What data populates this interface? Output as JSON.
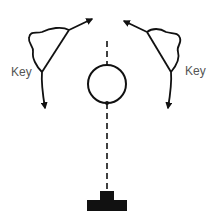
{
  "diagram": {
    "labels": {
      "left_key": "Key",
      "right_key": "Key"
    },
    "elements": {
      "left_key_symbol": "key-triangle-with-arrows",
      "right_key_symbol": "key-triangle-with-arrows",
      "center_circle": "open-circle",
      "dashed_axis": "vertical-dashed-line",
      "base_block": "inverted-t-block"
    },
    "colors": {
      "stroke": "#111111",
      "label": "#555555",
      "background": "#ffffff"
    }
  }
}
